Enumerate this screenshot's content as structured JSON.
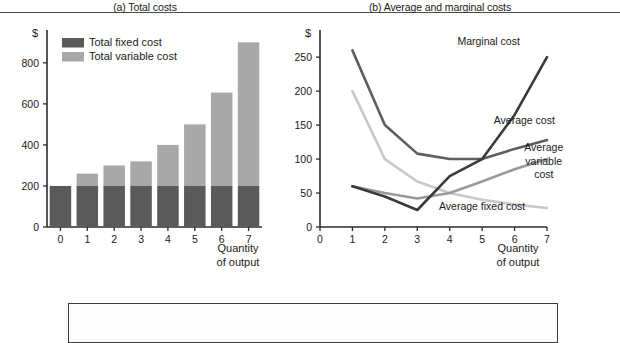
{
  "figure": {
    "panel_a_title": "(a) Total costs",
    "panel_b_title": "(b) Average and marginal costs",
    "currency_symbol": "$",
    "x_axis_title_line1": "Quantity",
    "x_axis_title_line2": "of output",
    "colors": {
      "total_fixed_cost": "#5a5a5a",
      "total_variable_cost": "#a8a8a8",
      "marginal_cost": "#3a3a3a",
      "average_cost": "#5e5e5e",
      "average_variable_cost": "#9a9a9a",
      "average_fixed_cost": "#c8c8c8",
      "axis": "#2b2b2b",
      "rule": "#4a4a4a"
    }
  },
  "legend": {
    "items": [
      {
        "label": "Total fixed cost",
        "color": "#5a5a5a"
      },
      {
        "label": "Total variable cost",
        "color": "#a8a8a8"
      }
    ]
  },
  "chart_data": [
    {
      "type": "bar",
      "title": "(a) Total costs",
      "stacked": true,
      "xlabel": "Quantity of output",
      "ylabel": "$",
      "categories": [
        "0",
        "1",
        "2",
        "3",
        "4",
        "5",
        "6",
        "7"
      ],
      "x_tick_labels": [
        "0",
        "1",
        "2",
        "3",
        "4",
        "5",
        "6",
        "7"
      ],
      "y_tick_labels": [
        "0",
        "200",
        "400",
        "600",
        "800"
      ],
      "y_ticks": [
        0,
        200,
        400,
        600,
        800
      ],
      "ylim": [
        0,
        960
      ],
      "grid": false,
      "legend_position": "upper-left-inside",
      "series": [
        {
          "name": "Total fixed cost",
          "values": [
            200,
            200,
            200,
            200,
            200,
            200,
            200,
            200
          ],
          "color": "#5a5a5a"
        },
        {
          "name": "Total variable cost",
          "values": [
            0,
            60,
            100,
            120,
            200,
            300,
            455,
            700
          ],
          "color": "#a8a8a8"
        }
      ],
      "totals": [
        200,
        260,
        300,
        320,
        400,
        500,
        655,
        900
      ]
    },
    {
      "type": "line",
      "title": "(b) Average and marginal costs",
      "xlabel": "Quantity of output",
      "ylabel": "$",
      "x": [
        1,
        2,
        3,
        4,
        5,
        6,
        7
      ],
      "x_tick_labels": [
        "0",
        "1",
        "2",
        "3",
        "4",
        "5",
        "6",
        "7"
      ],
      "x_ticks": [
        0,
        1,
        2,
        3,
        4,
        5,
        6,
        7
      ],
      "y_tick_labels": [
        "0",
        "50",
        "100",
        "150",
        "200",
        "250"
      ],
      "y_ticks": [
        0,
        50,
        100,
        150,
        200,
        250
      ],
      "ylim": [
        0,
        290
      ],
      "grid": false,
      "legend_position": "inline-annotations",
      "series": [
        {
          "name": "Marginal cost",
          "values": [
            260,
            150,
            108,
            100,
            100,
            150,
            250
          ],
          "color": "#3a3a3a"
        },
        {
          "name": "Average cost",
          "values": [
            260,
            150,
            108,
            100,
            100,
            115,
            128
          ],
          "color": "#5e5e5e"
        },
        {
          "name": "Average variable cost",
          "values": [
            60,
            50,
            42,
            50,
            67,
            85,
            100
          ],
          "color": "#9a9a9a"
        },
        {
          "name": "Average fixed cost",
          "values": [
            200,
            100,
            67,
            50,
            40,
            33,
            28
          ],
          "color": "#c8c8c8"
        }
      ],
      "marginal_cost_path": {
        "name": "Marginal cost",
        "values": [
          60,
          45,
          25,
          75,
          100,
          165,
          250
        ],
        "color": "#3a3a3a"
      },
      "annotations": [
        {
          "text": "Marginal cost",
          "x": 5.2,
          "y": 268
        },
        {
          "text": "Average cost",
          "x": 6.3,
          "y": 152
        },
        {
          "text": "Average",
          "x": 6.9,
          "y": 112
        },
        {
          "text": "variable",
          "x": 6.9,
          "y": 92
        },
        {
          "text": "cost",
          "x": 6.9,
          "y": 72
        },
        {
          "text": "Average fixed cost",
          "x": 5.0,
          "y": 25
        }
      ]
    }
  ]
}
